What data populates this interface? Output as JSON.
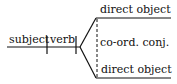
{
  "diagram": {
    "type": "sentence-diagram",
    "subject": "subject",
    "verb": "verb",
    "branches": {
      "upper": "direct object",
      "connector": "co-ord. conj.",
      "lower": "direct object"
    },
    "colors": {
      "line": "#111111",
      "text": "#111111",
      "background": "#ffffff"
    }
  }
}
